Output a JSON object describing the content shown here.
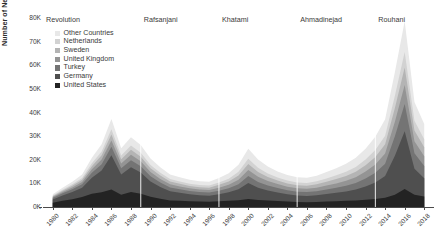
{
  "axes": {
    "y_title": "Number of New Asylum Applicants",
    "y_ticks": [
      "0K",
      "10K",
      "20K",
      "30K",
      "40K",
      "50K",
      "60K",
      "70K",
      "80K"
    ],
    "x_ticks": [
      "1980",
      "1982",
      "1984",
      "1986",
      "1988",
      "1990",
      "1992",
      "1994",
      "1996",
      "1998",
      "2000",
      "2002",
      "2004",
      "2006",
      "2008",
      "2010",
      "2012",
      "2014",
      "2016",
      "2018"
    ]
  },
  "legend": {
    "items": [
      {
        "label": "Other Countries",
        "color": "#e8e8e8"
      },
      {
        "label": "Netherlands",
        "color": "#d2d2d2"
      },
      {
        "label": "Sweden",
        "color": "#b4b4b4"
      },
      {
        "label": "United Kingdom",
        "color": "#949494"
      },
      {
        "label": "Turkey",
        "color": "#747474"
      },
      {
        "label": "Germany",
        "color": "#4f4f4f"
      },
      {
        "label": "United States",
        "color": "#232323"
      }
    ]
  },
  "eras": [
    {
      "label": "Revolution",
      "start": 1979.0,
      "end": 1989.0
    },
    {
      "label": "Rafsanjani",
      "start": 1989.0,
      "end": 1997.0
    },
    {
      "label": "Khatami",
      "start": 1997.0,
      "end": 2005.0
    },
    {
      "label": "Ahmadinejad",
      "start": 2005.0,
      "end": 2013.0
    },
    {
      "label": "Rouhani",
      "start": 2013.0,
      "end": 2019.0
    }
  ],
  "chart_data": {
    "type": "area",
    "title": "",
    "xlabel": "",
    "ylabel": "Number of New Asylum Applicants",
    "xlim": [
      1979,
      2019
    ],
    "ylim": [
      0,
      80000
    ],
    "grid": false,
    "stacked": true,
    "legend_position": "upper-left inside",
    "x": [
      1980,
      1981,
      1982,
      1983,
      1984,
      1985,
      1986,
      1987,
      1988,
      1989,
      1990,
      1991,
      1992,
      1993,
      1994,
      1995,
      1996,
      1997,
      1998,
      1999,
      2000,
      2001,
      2002,
      2003,
      2004,
      2005,
      2006,
      2007,
      2008,
      2009,
      2010,
      2011,
      2012,
      2013,
      2014,
      2015,
      2016,
      2017,
      2018
    ],
    "series": [
      {
        "name": "United States",
        "values": [
          1800,
          2600,
          3300,
          4200,
          5600,
          6200,
          7400,
          5200,
          6300,
          5600,
          4300,
          3500,
          2800,
          2600,
          2400,
          2300,
          2200,
          2400,
          2600,
          2900,
          3400,
          3000,
          2700,
          2500,
          2300,
          2100,
          2000,
          2100,
          2300,
          2400,
          2600,
          2800,
          3100,
          3400,
          3900,
          5200,
          7600,
          5200,
          4400
        ]
      },
      {
        "name": "Germany",
        "values": [
          1400,
          2300,
          3100,
          4000,
          6800,
          9200,
          14500,
          8600,
          10500,
          9000,
          6500,
          5000,
          3900,
          3400,
          3000,
          2700,
          2600,
          3000,
          3600,
          4600,
          6800,
          5200,
          4300,
          3600,
          3100,
          2800,
          2700,
          2900,
          3200,
          3600,
          4000,
          4600,
          5600,
          7000,
          9200,
          16500,
          24500,
          11000,
          7800
        ]
      },
      {
        "name": "Turkey",
        "values": [
          600,
          900,
          1100,
          1400,
          2100,
          2700,
          3600,
          2600,
          3000,
          2700,
          2200,
          1900,
          1600,
          1500,
          1400,
          1300,
          1300,
          1500,
          1700,
          2100,
          2900,
          2400,
          2100,
          1900,
          1700,
          1600,
          1600,
          1700,
          1900,
          2100,
          2400,
          2800,
          3400,
          4100,
          5200,
          8200,
          11500,
          6600,
          5200
        ]
      },
      {
        "name": "United Kingdom",
        "values": [
          400,
          600,
          800,
          1000,
          1500,
          2000,
          2700,
          2000,
          2300,
          2100,
          1800,
          1500,
          1300,
          1200,
          1100,
          1100,
          1100,
          1300,
          1500,
          1900,
          2600,
          2200,
          1900,
          1700,
          1500,
          1400,
          1400,
          1500,
          1700,
          1900,
          2100,
          2400,
          2900,
          3500,
          4300,
          6200,
          8000,
          5000,
          4100
        ]
      },
      {
        "name": "Sweden",
        "values": [
          350,
          500,
          700,
          900,
          1300,
          1800,
          2500,
          1800,
          2100,
          1900,
          1600,
          1400,
          1200,
          1100,
          1000,
          1000,
          1000,
          1200,
          1400,
          1800,
          2500,
          2000,
          1700,
          1500,
          1400,
          1300,
          1300,
          1400,
          1600,
          1800,
          2000,
          2300,
          2700,
          3200,
          4000,
          5800,
          7400,
          4600,
          3800
        ]
      },
      {
        "name": "Netherlands",
        "values": [
          300,
          450,
          600,
          800,
          1200,
          1600,
          2200,
          1600,
          1800,
          1700,
          1400,
          1200,
          1000,
          950,
          900,
          880,
          880,
          1000,
          1200,
          1600,
          2200,
          1800,
          1500,
          1300,
          1200,
          1150,
          1150,
          1250,
          1400,
          1600,
          1800,
          2000,
          2400,
          2900,
          3600,
          5200,
          6600,
          4100,
          3400
        ]
      },
      {
        "name": "Other Countries",
        "values": [
          550,
          800,
          1100,
          1500,
          2300,
          3100,
          4300,
          3100,
          3500,
          3200,
          2700,
          2300,
          2000,
          1800,
          1700,
          1650,
          1650,
          1900,
          2300,
          3000,
          4300,
          3500,
          2900,
          2500,
          2300,
          2200,
          2200,
          2400,
          2700,
          3000,
          3400,
          3900,
          4600,
          5600,
          6900,
          10000,
          13000,
          7900,
          6400
        ]
      }
    ],
    "totals_note": "stacked totals peak ~48K in 1986, ~32K in 2000, ~72K in 2016"
  }
}
